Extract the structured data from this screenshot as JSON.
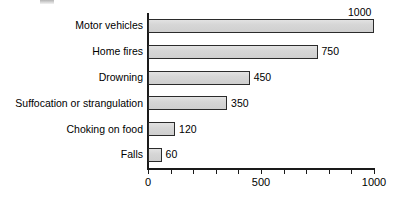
{
  "chart_data": {
    "type": "bar",
    "orientation": "horizontal",
    "title": "",
    "xlabel": "",
    "ylabel": "",
    "categories": [
      "Motor vehicles",
      "Home fires",
      "Drowning",
      "Suffocation or strangulation",
      "Choking on food",
      "Falls"
    ],
    "values": [
      1000,
      750,
      450,
      350,
      120,
      60
    ],
    "data_labels": [
      "1000",
      "750",
      "450",
      "350",
      "120",
      "60"
    ],
    "xlim": [
      0,
      1000
    ],
    "xticks": [
      0,
      100,
      200,
      300,
      400,
      500,
      600,
      700,
      800,
      900,
      1000
    ],
    "xtick_labels": [
      {
        "value": 0,
        "label": "0"
      },
      {
        "value": 500,
        "label": "500"
      },
      {
        "value": 1000,
        "label": "1000"
      }
    ],
    "grid": false,
    "legend": null,
    "bar_fill_color": "#d9d9d9",
    "bar_border_color": "#2b2b2b",
    "axis_color": "#1a1a1a",
    "background_color": "#ffffff"
  }
}
